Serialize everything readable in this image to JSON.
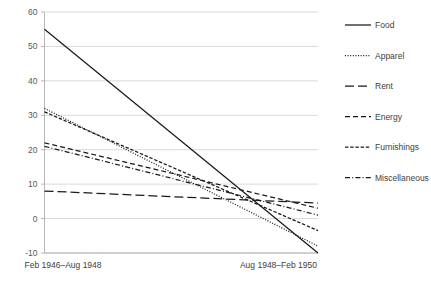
{
  "chart_data": {
    "type": "line",
    "title": "",
    "subtitle": "",
    "xlabel": "",
    "ylabel": "",
    "categories": [
      "Feb 1946–Aug 1948",
      "Aug 1948–Feb 1950"
    ],
    "x": [
      0,
      1
    ],
    "ylim": [
      -10,
      60
    ],
    "yticks": [
      -10,
      0,
      10,
      20,
      30,
      40,
      50,
      60
    ],
    "ytick_labels": [
      "-10",
      "0",
      "10",
      "20",
      "30",
      "40",
      "50",
      "60"
    ],
    "grid": true,
    "legend_position": "right",
    "series": [
      {
        "name": "Food",
        "values": [
          55,
          -10
        ],
        "dash_style": "solid",
        "dasharray": "none"
      },
      {
        "name": "Apparel",
        "values": [
          32,
          -8
        ],
        "dash_style": "dotted",
        "dasharray": "1,1.6"
      },
      {
        "name": "Rent",
        "values": [
          8,
          4.5
        ],
        "dash_style": "long-dash",
        "dasharray": "9,4"
      },
      {
        "name": "Energy",
        "values": [
          22,
          3
        ],
        "dash_style": "dashed",
        "dasharray": "5,3"
      },
      {
        "name": "Furnishings",
        "values": [
          31,
          -3.5
        ],
        "dash_style": "short-dash",
        "dasharray": "3.4,1.8"
      },
      {
        "name": "Miscellaneous",
        "values": [
          21,
          1
        ],
        "dash_style": "dash-dot",
        "dasharray": "5,2.2,1,2.2"
      }
    ],
    "colors": {
      "series_stroke": "#1a1a1a",
      "gridline": "#c8c8c8",
      "axis": "#a6a6a6",
      "tick_text": "#595959",
      "label_text": "#404040",
      "background": "#ffffff"
    }
  },
  "axis": {
    "y_ticks": [
      "60",
      "50",
      "40",
      "30",
      "20",
      "10",
      "0",
      "-10"
    ],
    "x_categories": [
      "Feb 1946–Aug 1948",
      "Aug 1948–Feb 1950"
    ]
  },
  "legend": {
    "items": [
      {
        "label": "Food"
      },
      {
        "label": "Apparel"
      },
      {
        "label": "Rent"
      },
      {
        "label": "Energy"
      },
      {
        "label": "Furnishings"
      },
      {
        "label": "Miscellaneous"
      }
    ]
  }
}
